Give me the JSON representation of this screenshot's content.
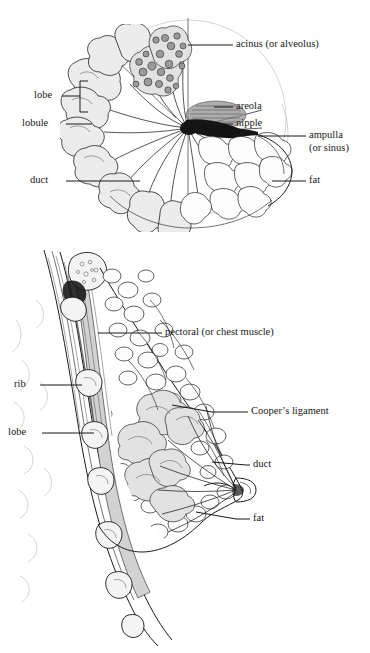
{
  "figure": {
    "panels": [
      {
        "id": "top-panel",
        "view": "anterior cutaway (front view)",
        "labels": [
          {
            "key": "acinus",
            "text": "acinus (or alveolus)"
          },
          {
            "key": "areola",
            "text": "areola"
          },
          {
            "key": "nipple",
            "text": "nipple"
          },
          {
            "key": "ampulla_1",
            "text": "ampulla"
          },
          {
            "key": "ampulla_2",
            "text": "(or sinus)"
          },
          {
            "key": "lobe",
            "text": "lobe"
          },
          {
            "key": "lobule",
            "text": "lobule"
          },
          {
            "key": "duct",
            "text": "duct"
          },
          {
            "key": "fat",
            "text": "fat"
          }
        ]
      },
      {
        "id": "bottom-panel",
        "view": "sagittal cross-section (side view)",
        "labels": [
          {
            "key": "pectoral",
            "text": "pectoral (or chest muscle)"
          },
          {
            "key": "coopers",
            "text": "Cooper’s ligament"
          },
          {
            "key": "duct",
            "text": "duct"
          },
          {
            "key": "fat",
            "text": "fat"
          },
          {
            "key": "rib",
            "text": "rib"
          },
          {
            "key": "lobe",
            "text": "lobe"
          }
        ]
      }
    ]
  },
  "colors": {
    "ink": "#181818",
    "paper": "#ffffff",
    "tissue_fill": "#ececec",
    "acinus_fill": "#9a9a9a",
    "muscle_fill": "#d2d2d2",
    "ghost_line": "#b9b9b9"
  }
}
